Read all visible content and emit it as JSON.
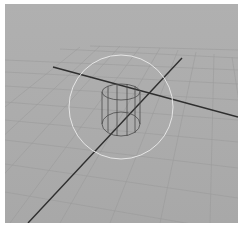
{
  "viewport": {
    "type": "3d-perspective-viewport",
    "background_color": "#ababab",
    "grid_color": "#9a9a9a",
    "axis_color": "#2e2e2e",
    "manipulator_color": "#e6e6e6",
    "object_wire_color": "#4a4a4a"
  },
  "scene": {
    "object": "cylinder",
    "display": "wireframe",
    "manipulator": "rotate-circle"
  }
}
